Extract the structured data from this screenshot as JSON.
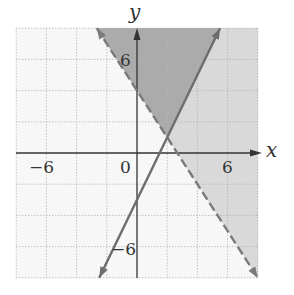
{
  "chart_data": {
    "type": "inequality-graph",
    "title": "",
    "xlabel": "x",
    "ylabel": "y",
    "xlim": [
      -8,
      8
    ],
    "ylim": [
      -8,
      8
    ],
    "grid": true,
    "grid_step": 2,
    "tick_labels": {
      "x": [
        {
          "value": -6,
          "label": "−6"
        },
        {
          "value": 0,
          "label": "0"
        },
        {
          "value": 6,
          "label": "6"
        }
      ],
      "y": [
        {
          "value": 6,
          "label": "6"
        },
        {
          "value": -6,
          "label": "−6"
        }
      ]
    },
    "lines": [
      {
        "name": "boundary-solid",
        "equation": "y = 2x - 3",
        "slope": 2,
        "intercept": -3,
        "style": "solid",
        "color": "#6d6d6d"
      },
      {
        "name": "boundary-dashed",
        "equation": "y = -1.5x + 4",
        "slope": -1.5,
        "intercept": 4,
        "style": "dashed",
        "color": "#7a7a7a"
      }
    ],
    "regions": [
      {
        "name": "solution-dashed",
        "inequality": "y > -1.5x + 4",
        "color": "#d9d9d9"
      },
      {
        "name": "overlap",
        "inequality": "y > -1.5x + 4 and y >= 2x - 3",
        "color": "#ababab"
      }
    ],
    "intersection": [
      2,
      1
    ]
  },
  "labels": {
    "x_axis": "x",
    "y_axis": "y",
    "x_neg6": "−6",
    "x_zero": "0",
    "x_pos6": "6",
    "y_pos6": "6",
    "y_neg6": "−6"
  }
}
